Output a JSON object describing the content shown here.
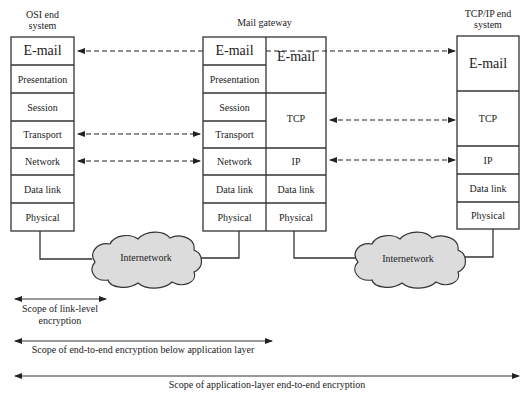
{
  "systems": {
    "osi": {
      "title_line1": "OSI end",
      "title_line2": "system",
      "layers": [
        "E-mail",
        "Presentation",
        "Session",
        "Transport",
        "Network",
        "Data link",
        "Physical"
      ]
    },
    "gateway": {
      "title": "Mail gateway",
      "left_layers": [
        "E-mail",
        "Presentation",
        "Session",
        "Transport",
        "Network",
        "Data link",
        "Physical"
      ],
      "right_layers": [
        "E-mail",
        "TCP",
        "IP",
        "Data link",
        "Physical"
      ]
    },
    "tcpip": {
      "title_line1": "TCP/IP end",
      "title_line2": "system",
      "layers": [
        "E-mail",
        "TCP",
        "IP",
        "Data link",
        "Physical"
      ]
    }
  },
  "clouds": [
    {
      "label": "Internetwork"
    },
    {
      "label": "Internetwork"
    }
  ],
  "scopes": {
    "link_level_line1": "Scope of link-level",
    "link_level_line2": "encryption",
    "end_to_end_below_app": "Scope of end-to-end encryption below application layer",
    "application_layer": "Scope of application-layer end-to-end encryption"
  },
  "colors": {
    "line": "#333333",
    "box_fill": "#ffffff",
    "cloud_fill": "#dcdcdc"
  }
}
